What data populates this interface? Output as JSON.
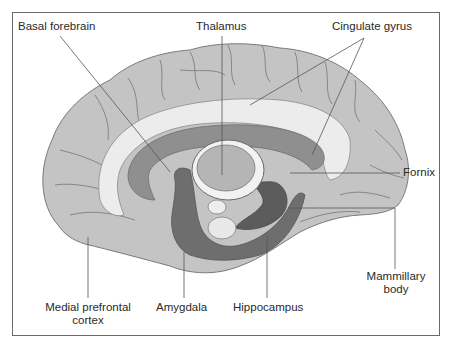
{
  "diagram": {
    "type": "anatomical illustration - medial (sagittal) view of the brain, limbic system",
    "labels": {
      "basal_forebrain": "Basal forebrain",
      "thalamus": "Thalamus",
      "cingulate_gyrus": "Cingulate gyrus",
      "fornix": "Fornix",
      "mammillary_body_line1": "Mammillary",
      "mammillary_body_line2": "body",
      "medial_prefrontal_line1": "Medial prefrontal",
      "medial_prefrontal_line2": "cortex",
      "amygdala": "Amygdala",
      "hippocampus": "Hippocampus"
    },
    "colors": {
      "cortex": "#c4c4c4",
      "cortex_outline": "#7a7a7a",
      "white_matter": "#eeeeee",
      "corpus_callosum": "#8f8f8f",
      "deep_structures": "#6e6e6e",
      "thalamus": "#b5b5b5",
      "leader_line": "#555555",
      "frame": "#6a6a6a"
    }
  }
}
